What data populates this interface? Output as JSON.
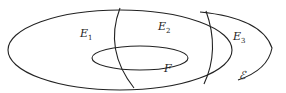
{
  "diagram": {
    "regions": [
      {
        "name": "E",
        "sub": "1"
      },
      {
        "name": "E",
        "sub": "2"
      },
      {
        "name": "E",
        "sub": "3"
      }
    ],
    "inner_set": "F",
    "outer_set": "ℰ",
    "stroke_color": "#222222"
  }
}
